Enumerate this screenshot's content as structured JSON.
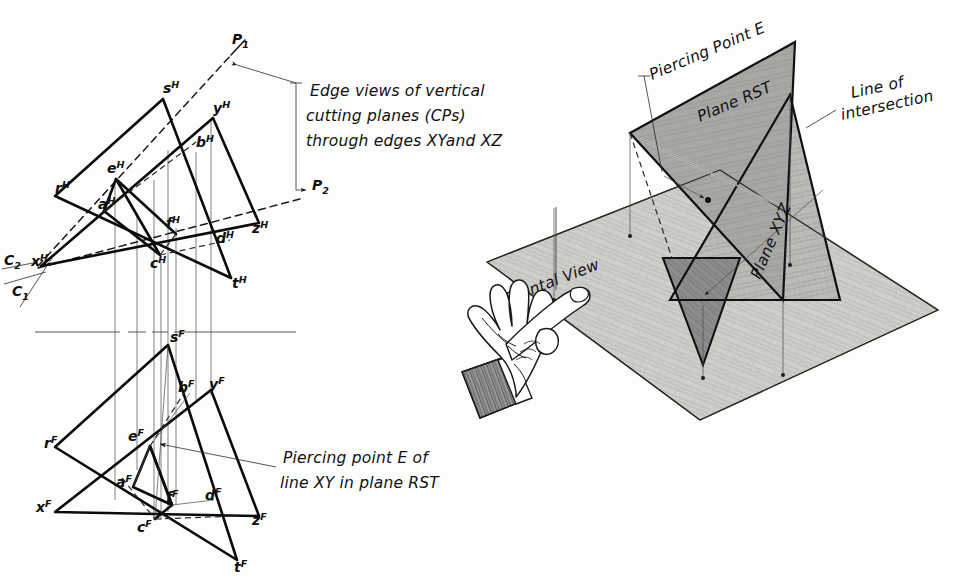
{
  "figure": {
    "background_color": "#fdfdfc",
    "ink_color": "#101010"
  },
  "annotations": {
    "edge_views": {
      "line1": "Edge views of vertical",
      "line2": "cutting planes (CPs)",
      "line3": "through edges XYand XZ"
    },
    "piercing_point": {
      "line1": "Piercing point E of",
      "line2": "line XY in plane RST"
    },
    "pictorial": {
      "piercing_point_e": "Piercing Point E",
      "plane_rst": "Plane RST",
      "plane_xyz": "Plane XYZ",
      "line_of_intersection_1": "Line of",
      "line_of_intersection_2": "intersection",
      "frontal_view": "Frontal View"
    }
  },
  "top_view": {
    "name": "Horizontal (top) view",
    "points": [
      {
        "id": "s-h",
        "base": "s",
        "sup": "H",
        "x": 163,
        "y": 93
      },
      {
        "id": "y-h",
        "base": "y",
        "sup": "H",
        "x": 213,
        "y": 113
      },
      {
        "id": "b-h",
        "base": "b",
        "sup": "H",
        "x": 196,
        "y": 147
      },
      {
        "id": "r-h",
        "base": "r",
        "sup": "H",
        "x": 55,
        "y": 193
      },
      {
        "id": "e-h",
        "base": "e",
        "sup": "H",
        "x": 115,
        "y": 173
      },
      {
        "id": "a-h",
        "base": "a",
        "sup": "H",
        "x": 106,
        "y": 205
      },
      {
        "id": "f-h",
        "base": "f",
        "sup": "H",
        "x": 171,
        "y": 228
      },
      {
        "id": "d-h",
        "base": "d",
        "sup": "H",
        "x": 222,
        "y": 238
      },
      {
        "id": "z-h",
        "base": "z",
        "sup": "H",
        "x": 258,
        "y": 229
      },
      {
        "id": "c-h",
        "base": "c",
        "sup": "H",
        "x": 156,
        "y": 262
      },
      {
        "id": "t-h",
        "base": "t",
        "sup": "H",
        "x": 231,
        "y": 282
      },
      {
        "id": "x-h",
        "base": "x",
        "sup": "H",
        "x": 41,
        "y": 262
      }
    ],
    "cutting_planes": [
      {
        "id": "p1",
        "base": "P",
        "sub": "1",
        "x": 235,
        "y": 40
      },
      {
        "id": "p2",
        "base": "P",
        "sub": "2",
        "x": 318,
        "y": 185
      },
      {
        "id": "c2",
        "base": "C",
        "sub": "2",
        "x": 8,
        "y": 258
      },
      {
        "id": "c1",
        "base": "C",
        "sub": "1",
        "x": 14,
        "y": 288
      }
    ]
  },
  "front_view": {
    "name": "Frontal view",
    "points": [
      {
        "id": "s-f",
        "base": "s",
        "sup": "F",
        "x": 171,
        "y": 338
      },
      {
        "id": "b-f",
        "base": "b",
        "sup": "F",
        "x": 184,
        "y": 388
      },
      {
        "id": "y-f",
        "base": "y",
        "sup": "F",
        "x": 213,
        "y": 385
      },
      {
        "id": "e-f",
        "base": "e",
        "sup": "F",
        "x": 136,
        "y": 434
      },
      {
        "id": "r-f",
        "base": "r",
        "sup": "F",
        "x": 53,
        "y": 444
      },
      {
        "id": "a-f",
        "base": "a",
        "sup": "F",
        "x": 123,
        "y": 481
      },
      {
        "id": "f-f",
        "base": "f",
        "sup": "F",
        "x": 172,
        "y": 497
      },
      {
        "id": "d-f",
        "base": "d",
        "sup": "F",
        "x": 211,
        "y": 496
      },
      {
        "id": "x-f",
        "base": "x",
        "sup": "F",
        "x": 46,
        "y": 508
      },
      {
        "id": "c-f",
        "base": "c",
        "sup": "F",
        "x": 143,
        "y": 526
      },
      {
        "id": "z-f",
        "base": "z",
        "sup": "F",
        "x": 256,
        "y": 521
      },
      {
        "id": "t-f",
        "base": "t",
        "sup": "F",
        "x": 236,
        "y": 568
      }
    ]
  },
  "colors": {
    "ground_plane": "#cfcfcb",
    "plane_rst_fill": "#a8a8a6",
    "plane_xyz_fill": "#bcbcba",
    "shadow_dark": "#8d8d8b",
    "line": "#0b0b0b"
  }
}
